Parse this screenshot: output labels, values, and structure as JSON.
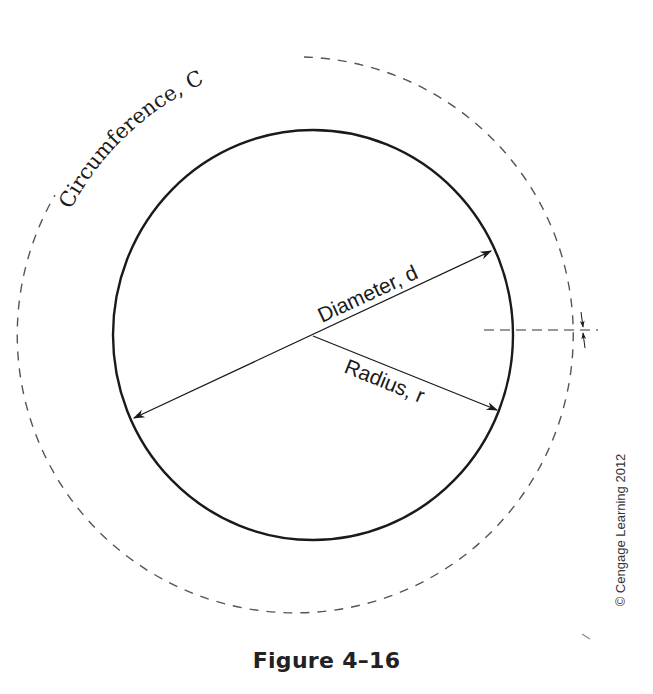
{
  "figure": {
    "caption": "Figure 4–16",
    "copyright": "© Cengage Learning 2012"
  },
  "labels": {
    "circumference": "Circumference, C",
    "diameter": "Diameter, d",
    "radius": "Radius, r"
  },
  "geometry": {
    "circle": {
      "cx": 313,
      "cy": 335,
      "rx": 200,
      "ry": 205
    },
    "circumference_circle": {
      "cx": 313,
      "cy": 335,
      "r": 278,
      "style": "dashed"
    }
  },
  "colors": {
    "stroke": "#1a1a1a",
    "dashed": "#555555",
    "background": "#ffffff"
  }
}
